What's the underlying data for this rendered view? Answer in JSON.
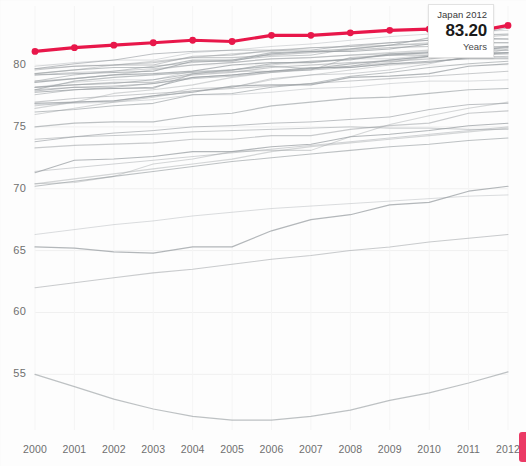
{
  "chart_data": {
    "type": "line",
    "title": "",
    "subtitle": "",
    "xlabel": "",
    "ylabel": "",
    "categories": [
      2000,
      2001,
      2002,
      2003,
      2004,
      2005,
      2006,
      2007,
      2008,
      2009,
      2010,
      2011,
      2012
    ],
    "xlim": [
      2000,
      2012
    ],
    "ylim": [
      50.5,
      83.8
    ],
    "yticks": [
      55,
      60,
      65,
      70,
      75,
      80
    ],
    "xticks": [
      "2000",
      "2001",
      "2002",
      "2003",
      "2004",
      "2005",
      "2006",
      "2007",
      "2008",
      "2009",
      "2010",
      "2011",
      "2012"
    ],
    "grid": true,
    "legend": "none",
    "highlight_series": "Japan",
    "highlight_color": "#e8174a",
    "base_color": "#9a9fa3",
    "annotations": [
      {
        "name": "tooltip",
        "label": "Japan 2012",
        "value": "83.20",
        "units": "Years"
      }
    ],
    "series": [
      {
        "name": "Japan",
        "highlight": true,
        "values": [
          81.1,
          81.4,
          81.6,
          81.8,
          82.0,
          81.9,
          82.4,
          82.4,
          82.6,
          82.8,
          82.9,
          82.6,
          83.2
        ]
      },
      {
        "name": "Switzerland",
        "highlight": false,
        "values": [
          79.9,
          80.2,
          80.4,
          80.4,
          81.0,
          81.2,
          81.5,
          81.7,
          82.0,
          82.3,
          82.5,
          82.7,
          82.8
        ]
      },
      {
        "name": "Italy",
        "highlight": false,
        "values": [
          79.6,
          79.9,
          80.0,
          80.0,
          80.7,
          80.8,
          81.2,
          81.4,
          81.5,
          81.8,
          82.0,
          82.2,
          82.4
        ]
      },
      {
        "name": "Spain",
        "highlight": false,
        "values": [
          79.3,
          79.6,
          79.8,
          79.8,
          80.4,
          80.4,
          81.0,
          81.1,
          81.3,
          81.6,
          82.2,
          82.4,
          82.5
        ]
      },
      {
        "name": "Iceland",
        "highlight": false,
        "values": [
          79.7,
          80.1,
          80.4,
          80.9,
          81.1,
          81.2,
          81.2,
          81.2,
          81.6,
          81.8,
          82.0,
          82.4,
          83.0
        ]
      },
      {
        "name": "Australia",
        "highlight": false,
        "values": [
          79.3,
          79.6,
          80.0,
          80.3,
          80.6,
          80.9,
          81.1,
          81.4,
          81.5,
          81.6,
          81.8,
          82.0,
          82.1
        ]
      },
      {
        "name": "Sweden",
        "highlight": false,
        "values": [
          79.7,
          79.9,
          80.0,
          80.2,
          80.6,
          80.6,
          80.8,
          81.0,
          81.2,
          81.4,
          81.5,
          81.8,
          81.8
        ]
      },
      {
        "name": "Israel",
        "highlight": false,
        "values": [
          78.7,
          79.2,
          79.5,
          79.9,
          80.2,
          80.4,
          80.7,
          80.8,
          81.3,
          81.6,
          81.7,
          81.8,
          81.8
        ]
      },
      {
        "name": "France",
        "highlight": false,
        "values": [
          79.2,
          79.3,
          79.4,
          79.5,
          80.3,
          80.3,
          80.9,
          81.1,
          81.1,
          81.3,
          81.7,
          82.2,
          82.1
        ]
      },
      {
        "name": "Norway",
        "highlight": false,
        "values": [
          78.7,
          78.9,
          79.2,
          79.6,
          80.0,
          80.2,
          80.5,
          80.6,
          80.8,
          81.0,
          81.2,
          81.4,
          81.5
        ]
      },
      {
        "name": "Canada",
        "highlight": false,
        "values": [
          79.2,
          79.4,
          79.5,
          79.7,
          80.0,
          80.2,
          80.5,
          80.6,
          80.8,
          80.9,
          81.1,
          81.4,
          81.5
        ]
      },
      {
        "name": "Netherlands",
        "highlight": false,
        "values": [
          78.2,
          78.4,
          78.5,
          78.8,
          79.3,
          79.6,
          80.1,
          80.3,
          80.4,
          80.9,
          81.0,
          81.3,
          81.2
        ]
      },
      {
        "name": "New Zealand",
        "highlight": false,
        "values": [
          78.6,
          78.9,
          79.2,
          79.3,
          79.5,
          80.0,
          80.2,
          80.2,
          80.5,
          80.8,
          81.0,
          81.2,
          81.4
        ]
      },
      {
        "name": "Austria",
        "highlight": false,
        "values": [
          78.2,
          78.6,
          78.8,
          78.8,
          79.5,
          79.6,
          80.0,
          80.3,
          80.5,
          80.5,
          80.8,
          81.1,
          81.2
        ]
      },
      {
        "name": "Luxembourg",
        "highlight": false,
        "values": [
          78.0,
          78.2,
          78.1,
          78.1,
          79.3,
          79.5,
          79.5,
          79.6,
          80.6,
          80.8,
          80.8,
          81.1,
          81.5
        ]
      },
      {
        "name": "Greece",
        "highlight": false,
        "values": [
          78.0,
          78.7,
          79.0,
          79.2,
          79.4,
          79.6,
          79.9,
          79.7,
          80.1,
          80.4,
          80.7,
          80.8,
          81.0
        ]
      },
      {
        "name": "United Kingdom",
        "highlight": false,
        "values": [
          77.9,
          78.2,
          78.3,
          78.5,
          79.0,
          79.2,
          79.5,
          79.7,
          79.9,
          80.4,
          80.7,
          81.0,
          81.0
        ]
      },
      {
        "name": "Korea",
        "highlight": false,
        "values": [
          76.0,
          76.5,
          77.0,
          77.4,
          77.9,
          78.2,
          78.8,
          79.2,
          79.6,
          80.0,
          80.2,
          80.6,
          81.3
        ]
      },
      {
        "name": "Germany",
        "highlight": false,
        "values": [
          78.2,
          78.4,
          78.6,
          78.6,
          79.2,
          79.4,
          79.8,
          80.0,
          80.2,
          80.3,
          80.5,
          80.8,
          80.9
        ]
      },
      {
        "name": "Finland",
        "highlight": false,
        "values": [
          77.6,
          78.0,
          78.2,
          78.5,
          78.9,
          79.1,
          79.4,
          79.6,
          79.8,
          80.1,
          80.2,
          80.6,
          80.7
        ]
      },
      {
        "name": "Belgium",
        "highlight": false,
        "values": [
          77.8,
          78.0,
          78.1,
          78.2,
          79.0,
          79.2,
          79.5,
          79.8,
          79.8,
          80.1,
          80.3,
          80.5,
          80.5
        ]
      },
      {
        "name": "Ireland",
        "highlight": false,
        "values": [
          76.5,
          77.0,
          77.7,
          78.0,
          78.4,
          79.0,
          79.4,
          79.7,
          79.9,
          80.2,
          80.7,
          80.8,
          81.0
        ]
      },
      {
        "name": "Portugal",
        "highlight": false,
        "values": [
          76.7,
          77.0,
          77.1,
          77.5,
          78.1,
          78.2,
          78.9,
          79.2,
          79.3,
          79.6,
          80.1,
          80.7,
          80.6
        ]
      },
      {
        "name": "Slovenia",
        "highlight": false,
        "values": [
          76.2,
          76.4,
          76.7,
          76.9,
          77.6,
          77.7,
          78.2,
          78.5,
          79.1,
          79.4,
          79.8,
          80.1,
          80.3
        ]
      },
      {
        "name": "Denmark",
        "highlight": false,
        "values": [
          76.9,
          77.0,
          77.1,
          77.5,
          77.8,
          78.3,
          78.4,
          78.4,
          79.0,
          79.1,
          79.3,
          79.9,
          80.1
        ]
      },
      {
        "name": "United States",
        "highlight": false,
        "values": [
          76.8,
          76.9,
          77.0,
          77.2,
          77.6,
          77.6,
          77.8,
          78.1,
          78.2,
          78.5,
          78.7,
          78.7,
          78.8
        ]
      },
      {
        "name": "Chile",
        "highlight": false,
        "values": [
          77.0,
          77.3,
          77.5,
          77.7,
          77.9,
          78.1,
          78.3,
          78.5,
          78.7,
          78.9,
          79.1,
          79.3,
          79.5
        ]
      },
      {
        "name": "Czech Republic",
        "highlight": false,
        "values": [
          75.0,
          75.3,
          75.4,
          75.4,
          75.9,
          76.1,
          76.7,
          77.0,
          77.3,
          77.4,
          77.7,
          78.0,
          78.1
        ]
      },
      {
        "name": "Poland",
        "highlight": false,
        "values": [
          73.8,
          74.2,
          74.5,
          74.7,
          75.0,
          75.1,
          75.3,
          75.4,
          75.6,
          75.8,
          76.4,
          76.8,
          76.9
        ]
      },
      {
        "name": "Estonia",
        "highlight": false,
        "values": [
          70.4,
          70.5,
          71.0,
          72.0,
          72.4,
          73.0,
          73.1,
          73.1,
          74.2,
          75.2,
          75.9,
          76.5,
          77.0
        ]
      },
      {
        "name": "Slovak Republic",
        "highlight": false,
        "values": [
          73.3,
          73.5,
          73.6,
          73.7,
          74.0,
          74.0,
          74.3,
          74.3,
          74.8,
          75.1,
          75.3,
          76.1,
          76.3
        ]
      },
      {
        "name": "Mexico",
        "highlight": false,
        "values": [
          74.0,
          74.2,
          74.3,
          74.4,
          74.6,
          74.7,
          74.8,
          74.9,
          75.0,
          74.9,
          74.9,
          74.8,
          74.8
        ]
      },
      {
        "name": "Hungary",
        "highlight": false,
        "values": [
          71.3,
          72.3,
          72.4,
          72.6,
          73.0,
          73.0,
          73.4,
          73.6,
          74.2,
          74.4,
          74.7,
          75.1,
          75.3
        ]
      },
      {
        "name": "Turkey",
        "highlight": false,
        "values": [
          70.4,
          70.8,
          71.2,
          71.6,
          72.0,
          72.4,
          73.0,
          73.4,
          73.7,
          74.0,
          74.3,
          74.6,
          74.9
        ]
      },
      {
        "name": "China",
        "highlight": false,
        "values": [
          71.4,
          71.7,
          72.0,
          72.3,
          72.6,
          72.9,
          73.2,
          73.5,
          73.8,
          74.1,
          74.4,
          74.7,
          75.0
        ]
      },
      {
        "name": "Brazil",
        "highlight": false,
        "values": [
          70.2,
          70.6,
          71.0,
          71.4,
          71.8,
          72.2,
          72.5,
          72.8,
          73.1,
          73.4,
          73.6,
          73.9,
          74.1
        ]
      },
      {
        "name": "Russian Federation",
        "highlight": false,
        "values": [
          65.3,
          65.2,
          64.9,
          64.8,
          65.3,
          65.3,
          66.6,
          67.5,
          67.9,
          68.7,
          68.9,
          69.8,
          70.2
        ]
      },
      {
        "name": "Indonesia",
        "highlight": false,
        "values": [
          66.3,
          66.7,
          67.1,
          67.4,
          67.8,
          68.1,
          68.4,
          68.6,
          68.8,
          69.0,
          69.2,
          69.4,
          69.5
        ]
      },
      {
        "name": "India",
        "highlight": false,
        "values": [
          62.0,
          62.4,
          62.8,
          63.2,
          63.5,
          63.9,
          64.3,
          64.6,
          65.0,
          65.3,
          65.7,
          66.0,
          66.3
        ]
      },
      {
        "name": "South Africa",
        "highlight": false,
        "values": [
          55.0,
          54.0,
          53.0,
          52.2,
          51.6,
          51.3,
          51.3,
          51.6,
          52.1,
          52.9,
          53.5,
          54.3,
          55.2
        ]
      }
    ]
  },
  "axes": {
    "y_labels": [
      "80",
      "75",
      "70",
      "65",
      "60",
      "55"
    ],
    "x_labels": [
      "2000",
      "2001",
      "2002",
      "2003",
      "2004",
      "2005",
      "2006",
      "2007",
      "2008",
      "2009",
      "2010",
      "2011",
      "2012"
    ]
  },
  "tooltip": {
    "title": "Japan 2012",
    "value": "83.20",
    "units": "Years"
  }
}
